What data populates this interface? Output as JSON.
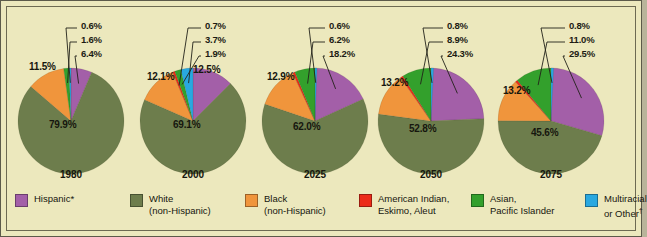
{
  "chart_data": {
    "type": "pie",
    "title": "",
    "subtitle": "",
    "xlabel": "",
    "ylabel": "",
    "legend_position": "bottom",
    "grid": false,
    "categories": [
      "Hispanic*",
      "White (non-Hispanic)",
      "Black (non-Hispanic)",
      "American Indian, Eskimo, Aleut",
      "Asian, Pacific Islander",
      "Multiracial or Other"
    ],
    "colors": [
      "#a35fa8",
      "#6d7d4c",
      "#f0953c",
      "#ec2b19",
      "#33a02c",
      "#29a8e0"
    ],
    "panels": [
      {
        "year": "1980",
        "slices": [
          {
            "label": "Hispanic*",
            "value": 6.4,
            "display": "6.4%",
            "color": "#a35fa8",
            "placement": "callout"
          },
          {
            "label": "White (non-Hispanic)",
            "value": 79.9,
            "display": "79.9%",
            "color": "#6d7d4c",
            "placement": "inside"
          },
          {
            "label": "Black (non-Hispanic)",
            "value": 11.5,
            "display": "11.5%",
            "color": "#f0953c",
            "placement": "inside"
          },
          {
            "label": "American Indian, Eskimo, Aleut",
            "value": 0.0,
            "display": "",
            "color": "#ec2b19",
            "placement": "none"
          },
          {
            "label": "Asian, Pacific Islander",
            "value": 1.6,
            "display": "1.6%",
            "color": "#33a02c",
            "placement": "callout"
          },
          {
            "label": "Multiracial or Other",
            "value": 0.6,
            "display": "0.6%",
            "color": "#29a8e0",
            "placement": "callout"
          }
        ]
      },
      {
        "year": "2000",
        "slices": [
          {
            "label": "Hispanic*",
            "value": 12.5,
            "display": "12.5%",
            "color": "#a35fa8",
            "placement": "inside"
          },
          {
            "label": "White (non-Hispanic)",
            "value": 69.1,
            "display": "69.1%",
            "color": "#6d7d4c",
            "placement": "inside"
          },
          {
            "label": "Black (non-Hispanic)",
            "value": 12.1,
            "display": "12.1%",
            "color": "#f0953c",
            "placement": "inside"
          },
          {
            "label": "American Indian, Eskimo, Aleut",
            "value": 0.7,
            "display": "0.7%",
            "color": "#ec2b19",
            "placement": "callout"
          },
          {
            "label": "Asian, Pacific Islander",
            "value": 1.9,
            "display": "1.9%",
            "color": "#33a02c",
            "placement": "callout"
          },
          {
            "label": "Multiracial or Other",
            "value": 3.7,
            "display": "3.7%",
            "color": "#29a8e0",
            "placement": "callout"
          }
        ]
      },
      {
        "year": "2025",
        "slices": [
          {
            "label": "Hispanic*",
            "value": 18.2,
            "display": "18.2%",
            "color": "#a35fa8",
            "placement": "callout"
          },
          {
            "label": "White (non-Hispanic)",
            "value": 62.0,
            "display": "62.0%",
            "color": "#6d7d4c",
            "placement": "inside"
          },
          {
            "label": "Black (non-Hispanic)",
            "value": 12.9,
            "display": "12.9%",
            "color": "#f0953c",
            "placement": "inside"
          },
          {
            "label": "American Indian, Eskimo, Aleut",
            "value": 0.7,
            "display": "",
            "color": "#ec2b19",
            "placement": "none"
          },
          {
            "label": "Asian, Pacific Islander",
            "value": 6.2,
            "display": "6.2%",
            "color": "#33a02c",
            "placement": "callout"
          },
          {
            "label": "Multiracial or Other",
            "value": 0.6,
            "display": "0.6%",
            "color": "#29a8e0",
            "placement": "callout"
          }
        ]
      },
      {
        "year": "2050",
        "slices": [
          {
            "label": "Hispanic*",
            "value": 24.3,
            "display": "24.3%",
            "color": "#a35fa8",
            "placement": "callout"
          },
          {
            "label": "White (non-Hispanic)",
            "value": 52.8,
            "display": "52.8%",
            "color": "#6d7d4c",
            "placement": "inside"
          },
          {
            "label": "Black (non-Hispanic)",
            "value": 13.2,
            "display": "13.2%",
            "color": "#f0953c",
            "placement": "inside"
          },
          {
            "label": "American Indian, Eskimo, Aleut",
            "value": 0.8,
            "display": "",
            "color": "#ec2b19",
            "placement": "none"
          },
          {
            "label": "Asian, Pacific Islander",
            "value": 8.9,
            "display": "8.9%",
            "color": "#33a02c",
            "placement": "callout"
          },
          {
            "label": "Multiracial or Other",
            "value": 0.8,
            "display": "0.8%",
            "color": "#29a8e0",
            "placement": "callout"
          }
        ]
      },
      {
        "year": "2075",
        "slices": [
          {
            "label": "Hispanic*",
            "value": 29.5,
            "display": "29.5%",
            "color": "#a35fa8",
            "placement": "callout"
          },
          {
            "label": "White (non-Hispanic)",
            "value": 45.6,
            "display": "45.6%",
            "color": "#6d7d4c",
            "placement": "inside"
          },
          {
            "label": "Black (non-Hispanic)",
            "value": 13.2,
            "display": "13.2%",
            "color": "#f0953c",
            "placement": "inside"
          },
          {
            "label": "American Indian, Eskimo, Aleut",
            "value": 0.7,
            "display": "",
            "color": "#ec2b19",
            "placement": "none"
          },
          {
            "label": "Asian, Pacific Islander",
            "value": 11.0,
            "display": "11.0%",
            "color": "#33a02c",
            "placement": "callout"
          },
          {
            "label": "Multiracial or Other",
            "value": 0.8,
            "display": "0.8%",
            "color": "#29a8e0",
            "placement": "callout"
          }
        ]
      }
    ]
  },
  "legend": {
    "items": [
      {
        "label_line1": "Hispanic*",
        "label_line2": "",
        "color": "#a35fa8",
        "name": "hispanic"
      },
      {
        "label_line1": "White",
        "label_line2": "(non-Hispanic)",
        "color": "#6d7d4c",
        "name": "white-non-hispanic"
      },
      {
        "label_line1": "Black",
        "label_line2": "(non-Hispanic)",
        "color": "#f0953c",
        "name": "black-non-hispanic"
      },
      {
        "label_line1": "American Indian,",
        "label_line2": "Eskimo, Aleut",
        "color": "#ec2b19",
        "name": "american-indian"
      },
      {
        "label_line1": "Asian,",
        "label_line2": "Pacific Islander",
        "color": "#33a02c",
        "name": "asian-pacific-islander"
      },
      {
        "label_line1": "Multiracial",
        "label_line2": "or Other",
        "label_line2_sup": "†",
        "color": "#29a8e0",
        "name": "multiracial-other"
      }
    ]
  },
  "style": {
    "background": "#ece8bd",
    "border": "#5c5a4a",
    "text": "#16160e"
  }
}
